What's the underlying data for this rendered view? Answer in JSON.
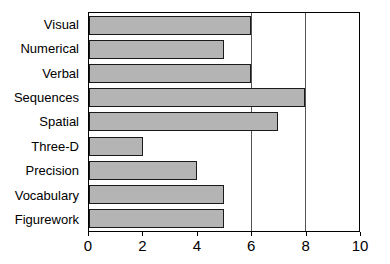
{
  "chart_data": {
    "type": "bar",
    "orientation": "horizontal",
    "title": "",
    "xlabel": "",
    "ylabel": "",
    "xlim": [
      0,
      10
    ],
    "xticks": [
      0,
      2,
      4,
      6,
      8,
      10
    ],
    "gridlines": [
      6,
      8
    ],
    "grid": true,
    "legend": false,
    "bar_color": "#b4b4b4",
    "bar_edge_color": "#1a1a1a",
    "categories": [
      "Visual",
      "Numerical",
      "Verbal",
      "Sequences",
      "Spatial",
      "Three-D",
      "Precision",
      "Vocabulary",
      "Figurework"
    ],
    "values": [
      6,
      5,
      6,
      8,
      7,
      2,
      4,
      5,
      5
    ]
  },
  "axis": {
    "tick_labels": [
      "0",
      "2",
      "4",
      "6",
      "8",
      "10"
    ]
  }
}
